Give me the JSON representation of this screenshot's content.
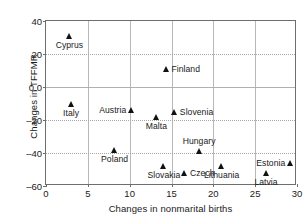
{
  "chart_data": {
    "type": "scatter",
    "title": "",
    "xlabel": "Changes in nonmarital births",
    "ylabel": "Changes in TFFMR",
    "xlim": [
      0,
      30
    ],
    "ylim": [
      -60,
      40
    ],
    "xticks": [
      "0",
      "5",
      "10",
      "15",
      "20",
      "25",
      "30"
    ],
    "xtick_values": [
      0,
      5,
      10,
      15,
      20,
      25,
      30
    ],
    "yticks": [
      "40",
      "20",
      "0.0",
      "‒20",
      "‒40",
      "‒60"
    ],
    "ytick_values": [
      40,
      20,
      0,
      -20,
      -40,
      -60
    ],
    "grid": "both",
    "legend": "none",
    "marker": "triangle-filled",
    "marker_color": "#111111",
    "points": [
      {
        "label": "Cyprus",
        "x": 2.8,
        "y": 31,
        "label_pos": "below"
      },
      {
        "label": "Italy",
        "x": 3.0,
        "y": -10,
        "label_pos": "below"
      },
      {
        "label": "Finland",
        "x": 14.4,
        "y": 11,
        "label_pos": "right"
      },
      {
        "label": "Austria",
        "x": 10.2,
        "y": -14,
        "label_pos": "left"
      },
      {
        "label": "Malta",
        "x": 13.2,
        "y": -18,
        "label_pos": "below"
      },
      {
        "label": "Slovenia",
        "x": 15.4,
        "y": -15,
        "label_pos": "right"
      },
      {
        "label": "Poland",
        "x": 8.2,
        "y": -38,
        "label_pos": "below"
      },
      {
        "label": "Hungary",
        "x": 18.3,
        "y": -39,
        "label_pos": "above"
      },
      {
        "label": "Slovakia",
        "x": 14.1,
        "y": -48,
        "label_pos": "below"
      },
      {
        "label": "Czech",
        "x": 16.6,
        "y": -52,
        "label_pos": "right"
      },
      {
        "label": "Lithuania",
        "x": 21.0,
        "y": -48,
        "label_pos": "below"
      },
      {
        "label": "Estonia",
        "x": 29.2,
        "y": -46,
        "label_pos": "left"
      },
      {
        "label": "Latvia",
        "x": 26.3,
        "y": -52,
        "label_pos": "below"
      }
    ]
  }
}
